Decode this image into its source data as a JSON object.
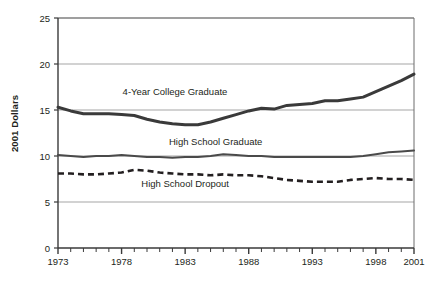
{
  "chart_data": {
    "type": "line",
    "title": "",
    "xlabel": "",
    "ylabel": "2001 Dollars",
    "xlim": [
      1973,
      2001
    ],
    "ylim": [
      0,
      25
    ],
    "ytick_values": [
      0,
      5,
      10,
      15,
      20,
      25
    ],
    "ytick_labels": [
      "0",
      "5",
      "10",
      "15",
      "20",
      "25"
    ],
    "xtick_values": [
      1973,
      1978,
      1983,
      1988,
      1993,
      1998,
      2001
    ],
    "xtick_labels": [
      "1973",
      "1978",
      "1983",
      "1988",
      "1993",
      "1998",
      "2001"
    ],
    "minor_xticks_every": 1,
    "grid": "horizontal",
    "legend": "inline-annotations",
    "x": [
      1973,
      1974,
      1975,
      1976,
      1977,
      1978,
      1979,
      1980,
      1981,
      1982,
      1983,
      1984,
      1985,
      1986,
      1987,
      1988,
      1989,
      1990,
      1991,
      1992,
      1993,
      1994,
      1995,
      1996,
      1997,
      1998,
      1999,
      2000,
      2001
    ],
    "series": [
      {
        "name": "4-Year College Graduate",
        "style": "solid-thick",
        "color": "#3a3a3a",
        "label_x": 1982.2,
        "label_y": 16.6,
        "values": [
          15.3,
          14.9,
          14.6,
          14.6,
          14.6,
          14.5,
          14.4,
          14.0,
          13.7,
          13.5,
          13.4,
          13.4,
          13.7,
          14.1,
          14.5,
          14.9,
          15.2,
          15.1,
          15.5,
          15.6,
          15.7,
          16.0,
          16.0,
          16.2,
          16.4,
          17.0,
          17.6,
          18.2,
          18.9
        ]
      },
      {
        "name": "High School Graduate",
        "style": "solid-medium",
        "color": "#4a4a4a",
        "label_x": 1985.4,
        "label_y": 11.2,
        "values": [
          10.1,
          10.0,
          9.9,
          10.0,
          10.0,
          10.1,
          10.0,
          9.9,
          9.9,
          9.8,
          9.9,
          9.9,
          10.0,
          10.2,
          10.1,
          10.0,
          10.0,
          9.9,
          9.9,
          9.9,
          9.9,
          9.9,
          9.9,
          9.9,
          10.0,
          10.2,
          10.4,
          10.5,
          10.6
        ]
      },
      {
        "name": "High School Dropout",
        "style": "dashed",
        "color": "#231f20",
        "label_x": 1983.0,
        "label_y": 6.6,
        "values": [
          8.1,
          8.1,
          8.0,
          8.0,
          8.1,
          8.2,
          8.5,
          8.4,
          8.2,
          8.1,
          8.0,
          8.0,
          7.9,
          8.0,
          7.9,
          7.9,
          7.8,
          7.6,
          7.4,
          7.3,
          7.2,
          7.2,
          7.2,
          7.4,
          7.5,
          7.6,
          7.5,
          7.5,
          7.4
        ]
      }
    ]
  },
  "axis": {
    "y_title": "2001 Dollars"
  }
}
